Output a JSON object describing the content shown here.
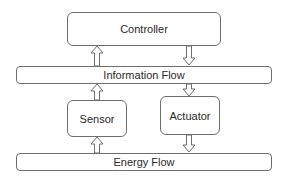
{
  "diagram": {
    "controller": {
      "label": "Controller"
    },
    "information_flow": {
      "label": "Information Flow"
    },
    "sensor": {
      "label": "Sensor"
    },
    "actuator": {
      "label": "Actuator"
    },
    "energy_flow": {
      "label": "Energy Flow"
    },
    "arrows": [
      {
        "from": "information_flow",
        "to": "controller",
        "direction": "up"
      },
      {
        "from": "controller",
        "to": "information_flow",
        "direction": "down"
      },
      {
        "from": "sensor",
        "to": "information_flow",
        "direction": "up"
      },
      {
        "from": "information_flow",
        "to": "actuator",
        "direction": "down"
      },
      {
        "from": "energy_flow",
        "to": "sensor",
        "direction": "up"
      },
      {
        "from": "actuator",
        "to": "energy_flow",
        "direction": "down"
      }
    ],
    "colors": {
      "stroke": "#6e6e6e",
      "fill": "#ffffff",
      "text": "#2a2a2a"
    }
  }
}
